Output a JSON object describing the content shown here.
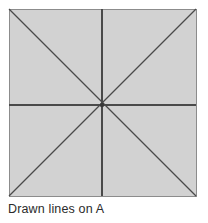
{
  "figure": {
    "caption": "Drawn lines on A",
    "shape_label": "A",
    "colors": {
      "background": "#ffffff",
      "square_fill": "#d2d2d2",
      "square_border": "#8c8c8c",
      "line": "#4a4a4a",
      "caption_text": "#2b2b2b"
    },
    "square": {
      "name": "sheet-a",
      "x": 9,
      "y": 9,
      "width": 187,
      "height": 187,
      "border_width": 1
    },
    "lines": [
      {
        "name": "diagonal-top-left-to-bottom-right",
        "kind": "diagonal",
        "x1": 9,
        "y1": 9,
        "x2": 196,
        "y2": 196
      },
      {
        "name": "diagonal-bottom-left-to-top-right",
        "kind": "diagonal",
        "x1": 9,
        "y1": 196,
        "x2": 196,
        "y2": 9
      },
      {
        "name": "horizontal-midline",
        "kind": "horizontal",
        "x1": 9,
        "y1": 105,
        "x2": 196,
        "y2": 105
      },
      {
        "name": "vertical-midline",
        "kind": "vertical",
        "x1": 102,
        "y1": 9,
        "x2": 102,
        "y2": 196
      }
    ],
    "center_point": {
      "name": "lines-intersection",
      "cx": 102,
      "cy": 105,
      "r": 2.2
    },
    "line_width": 1.3,
    "line_count": 4
  }
}
